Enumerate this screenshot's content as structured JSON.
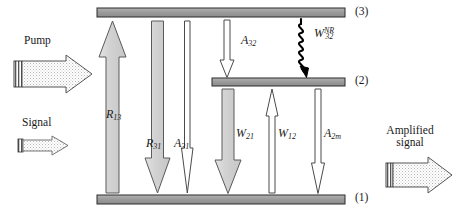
{
  "figure": {
    "background_color": "#ffffff",
    "line_color": "#1a1a1a",
    "level_bar_fill": "#9a9a9a",
    "arrow_gray_fill": "#d4d4d4",
    "arrow_white_fill": "#ffffff",
    "squiggle_color": "#000000"
  },
  "levels": [
    {
      "id": "level-3",
      "label": "(3)",
      "x": 97,
      "y": 8,
      "width": 248,
      "height": 9,
      "label_x": 355,
      "label_y": 6
    },
    {
      "id": "level-2",
      "label": "(2)",
      "x": 212,
      "y": 78,
      "width": 133,
      "height": 8,
      "label_x": 355,
      "label_y": 76
    },
    {
      "id": "level-1",
      "label": "(1)",
      "x": 97,
      "y": 195,
      "width": 248,
      "height": 9,
      "label_x": 355,
      "label_y": 192
    }
  ],
  "external_arrows": [
    {
      "id": "pump-arrow",
      "caption": "Pump",
      "caption_x": 24,
      "caption_y": 36,
      "style": "thick-stippled-striped-tail",
      "direction": "right",
      "x": 14,
      "y": 55,
      "width": 78,
      "height": 38
    },
    {
      "id": "signal-arrow",
      "caption": "Signal",
      "caption_x": 22,
      "caption_y": 117,
      "style": "thin-stippled-striped-tail",
      "direction": "right",
      "x": 18,
      "y": 137,
      "width": 50,
      "height": 18
    },
    {
      "id": "amplified-signal-arrow",
      "caption_line1": "Amplified",
      "caption_line2": "signal",
      "caption_x": 382,
      "caption_y": 125,
      "style": "thick-stippled-striped-tail",
      "direction": "right",
      "x": 386,
      "y": 158,
      "width": 67,
      "height": 36
    }
  ],
  "transitions": [
    {
      "id": "R13",
      "symbol": "R",
      "sub": "13",
      "sup": "",
      "label_x": 108,
      "label_y": 115,
      "direction": "up",
      "fill": "gray",
      "from_level": 1,
      "to_level": 3,
      "x": 112,
      "y_top": 21,
      "y_bottom": 193,
      "shaft_width": 13,
      "head_width": 27,
      "head_length": 36
    },
    {
      "id": "R31",
      "symbol": "R",
      "sub": "31",
      "sup": "",
      "label_x": 148,
      "label_y": 144,
      "direction": "down",
      "fill": "gray",
      "from_level": 3,
      "to_level": 1,
      "x": 157,
      "y_top": 21,
      "y_bottom": 193,
      "shaft_width": 11,
      "head_width": 26,
      "head_length": 35
    },
    {
      "id": "A31",
      "symbol": "A",
      "sub": "31",
      "sup": "",
      "label_x": 176,
      "label_y": 144,
      "direction": "down",
      "fill": "white",
      "from_level": 3,
      "to_level": 1,
      "x": 187,
      "y_top": 21,
      "y_bottom": 193,
      "shaft_width": 6,
      "head_width": 11,
      "head_length": 45
    },
    {
      "id": "A32",
      "symbol": "A",
      "sub": "32",
      "sup": "",
      "label_x": 243,
      "label_y": 38,
      "direction": "down",
      "fill": "white",
      "from_level": 3,
      "to_level": 2,
      "x": 227,
      "y_top": 20,
      "y_bottom": 77,
      "shaft_width": 7,
      "head_width": 13,
      "head_length": 17
    },
    {
      "id": "W32NR",
      "symbol": "W",
      "sub": "32",
      "sup": "NR",
      "label_x": 316,
      "label_y": 31,
      "direction": "down",
      "fill": "squiggle",
      "from_level": 3,
      "to_level": 2,
      "x": 301,
      "y_top": 19,
      "y_bottom": 77,
      "shaft_width": 0,
      "head_width": 0,
      "head_length": 0
    },
    {
      "id": "W21",
      "symbol": "W",
      "sub": "21",
      "sup": "",
      "label_x": 238,
      "label_y": 133,
      "direction": "down",
      "fill": "gray",
      "from_level": 2,
      "to_level": 1,
      "x": 228,
      "y_top": 89,
      "y_bottom": 193,
      "shaft_width": 12,
      "head_width": 26,
      "head_length": 33
    },
    {
      "id": "W12",
      "symbol": "W",
      "sub": "12",
      "sup": "",
      "label_x": 276,
      "label_y": 133,
      "direction": "up",
      "fill": "white",
      "from_level": 1,
      "to_level": 2,
      "x": 272,
      "y_top": 89,
      "y_bottom": 193,
      "shaft_width": 6,
      "head_width": 12,
      "head_length": 27
    },
    {
      "id": "A2m",
      "symbol": "A",
      "sub": "2m",
      "sup": "",
      "label_x": 314,
      "label_y": 133,
      "direction": "down",
      "fill": "white",
      "from_level": 2,
      "to_level": 1,
      "x": 318,
      "y_top": 89,
      "y_bottom": 193,
      "shaft_width": 6,
      "head_width": 12,
      "head_length": 30
    }
  ]
}
